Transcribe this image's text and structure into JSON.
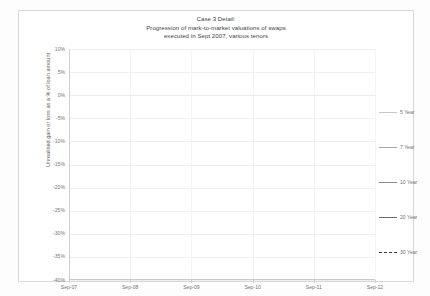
{
  "figure": {
    "title_lines": [
      "Case 3 Detail:",
      "Progression of mark-to-market valuations of swaps",
      "executed in Sept 2007, various tenors"
    ]
  },
  "axes": {
    "y_title": "Unrealised gain or loss as a % of loan amount",
    "y_tick_labels": [
      "10%",
      "5%",
      "0%",
      "-5%",
      "-10%",
      "-15%",
      "-20%",
      "-25%",
      "-30%",
      "-35%",
      "-40%"
    ],
    "x_tick_labels": [
      "Sep-07",
      "Sep-08",
      "Sep-09",
      "Sep-10",
      "Sep-11",
      "Sep-12"
    ]
  },
  "legend": {
    "items": [
      {
        "label": "5 Year",
        "color": "#c6c6c6",
        "style": "solid",
        "width": 1.0
      },
      {
        "label": "7 Year",
        "color": "#a8a8a8",
        "style": "solid",
        "width": 1.0
      },
      {
        "label": "10 Year",
        "color": "#8a8a8a",
        "style": "solid",
        "width": 1.0
      },
      {
        "label": "20 Year",
        "color": "#6b6b6b",
        "style": "solid",
        "width": 1.3
      },
      {
        "label": "30 Year",
        "color": "#3a3a3a",
        "style": "dashed",
        "width": 1.3
      }
    ]
  },
  "chart_data": {
    "type": "line",
    "title": "Case 3 Detail: Progression of mark-to-market valuations of swaps executed in Sept 2007, various tenors",
    "xlabel": "",
    "ylabel": "Unrealised gain or loss as a % of loan amount",
    "ylim": [
      -40,
      10
    ],
    "xlim": [
      0,
      60
    ],
    "ytick_values": [
      10,
      5,
      0,
      -5,
      -10,
      -15,
      -20,
      -25,
      -30,
      -35,
      -40
    ],
    "xtick_values": [
      0,
      12,
      24,
      36,
      48,
      60
    ],
    "xtick_labels": [
      "Sep-07",
      "Sep-08",
      "Sep-09",
      "Sep-10",
      "Sep-11",
      "Sep-12"
    ],
    "grid": "horizontal",
    "legend_position": "right",
    "x": [
      0,
      3,
      6,
      9,
      12,
      14,
      16,
      18,
      21,
      24,
      27,
      30,
      33,
      36,
      39,
      42,
      45,
      48,
      51,
      54,
      57,
      60
    ],
    "series": [
      {
        "name": "5 Year",
        "color": "#c6c6c6",
        "style": "solid",
        "values": [
          0.0,
          -0.2,
          -1.3,
          2.4,
          1.4,
          -3.0,
          -6.2,
          -7.0,
          -6.6,
          -5.5,
          -6.8,
          -6.6,
          -6.5,
          -7.6,
          -8.8,
          -9.0,
          -8.6,
          -7.7,
          -6.4,
          -5.5,
          -4.3,
          -3.0
        ]
      },
      {
        "name": "7 Year",
        "color": "#a8a8a8",
        "style": "solid",
        "values": [
          0.0,
          -0.3,
          -1.6,
          2.7,
          1.6,
          -4.4,
          -8.1,
          -8.9,
          -8.2,
          -6.5,
          -8.3,
          -8.4,
          -8.3,
          -9.6,
          -11.4,
          -11.6,
          -11.0,
          -10.4,
          -10.2,
          -10.0,
          -9.6,
          -8.8
        ]
      },
      {
        "name": "10 Year",
        "color": "#8a8a8a",
        "style": "solid",
        "values": [
          0.0,
          -0.4,
          -1.9,
          3.0,
          1.7,
          -6.6,
          -11.3,
          -12.2,
          -11.0,
          -8.0,
          -10.6,
          -10.8,
          -10.9,
          -12.6,
          -15.3,
          -15.6,
          -14.1,
          -13.4,
          -13.6,
          -14.0,
          -13.7,
          -12.6
        ]
      },
      {
        "name": "20 Year",
        "color": "#6b6b6b",
        "style": "solid",
        "values": [
          0.0,
          -0.5,
          -2.2,
          3.3,
          1.8,
          -10.6,
          -16.4,
          -17.2,
          -16.9,
          -9.3,
          -12.0,
          -12.2,
          -12.4,
          -14.2,
          -18.6,
          -19.4,
          -14.9,
          -14.6,
          -20.5,
          -26.6,
          -23.0,
          -28.5
        ]
      },
      {
        "name": "30 Year",
        "color": "#3a3a3a",
        "style": "dashed",
        "values": [
          0.0,
          -0.6,
          -2.6,
          2.9,
          1.4,
          -14.8,
          -23.0,
          -23.8,
          -22.3,
          -9.8,
          -13.4,
          -13.0,
          -13.1,
          -14.9,
          -19.4,
          -20.1,
          -14.4,
          -14.6,
          -21.6,
          -29.2,
          -24.4,
          -32.6
        ]
      }
    ]
  }
}
